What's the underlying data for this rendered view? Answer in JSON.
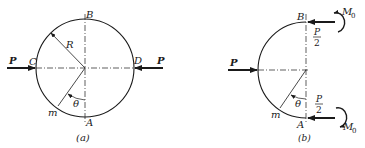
{
  "figure_a": {
    "caption": "(a)",
    "labels": {
      "top": "B",
      "bottom": "A",
      "left": "C",
      "right": "D",
      "radius": "R",
      "angle": "θ",
      "point": "m",
      "force_left": "P",
      "force_right": "P"
    }
  },
  "figure_b": {
    "caption": "(b)",
    "labels": {
      "top": "B",
      "bottom": "A",
      "angle": "θ",
      "point": "m",
      "force_left": "P",
      "force_top_num": "P",
      "force_top_den": "2",
      "force_bottom_num": "P",
      "force_bottom_den": "2",
      "moment_top": "M",
      "moment_top_sub": "0",
      "moment_bottom": "M",
      "moment_bottom_sub": "0"
    }
  },
  "colors": {
    "line": "#1a1a1a",
    "background": "#ffffff"
  }
}
